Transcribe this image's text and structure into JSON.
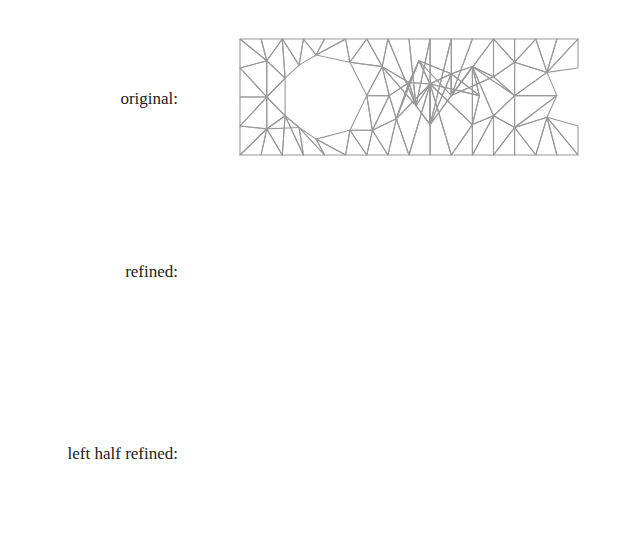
{
  "labels": {
    "original": "original:",
    "refined": "refined:",
    "left_half": "left half refined:"
  },
  "colors": {
    "mesh": "#9a9a9a",
    "frame": "#333333",
    "text": "#333333"
  },
  "chart_data": [
    {
      "type": "mesh",
      "title": "original:",
      "xlabel": "",
      "ylabel": "",
      "xlim": [
        0.0,
        1.2
      ],
      "ylim": [
        0.0,
        0.4
      ],
      "xticks": [
        "0.0",
        "0.2",
        "0.4",
        "0.6",
        "0.8",
        "1.0",
        "1.2"
      ],
      "yticks": [
        "0.0",
        "0.1",
        "0.2",
        "0.3",
        "0.4"
      ],
      "refinement": "none",
      "frame": {
        "left": 223,
        "top": 33,
        "right": 596,
        "bottom": 160
      },
      "data_px": {
        "x0": 240,
        "x1": 578,
        "y0": 155,
        "y1": 39
      }
    },
    {
      "type": "mesh",
      "title": "refined:",
      "xlim": [
        0.0,
        1.2
      ],
      "ylim": [
        0.0,
        0.4
      ],
      "xticks": [
        "0.0",
        "0.2",
        "0.4",
        "0.6",
        "0.8",
        "1.0",
        "1.2"
      ],
      "yticks": [
        "0.0",
        "0.1",
        "0.2",
        "0.3",
        "0.4"
      ],
      "refinement": "all",
      "frame": {
        "left": 223,
        "top": 205,
        "right": 596,
        "bottom": 333
      },
      "data_px": {
        "x0": 240,
        "x1": 578,
        "y0": 328,
        "y1": 213
      }
    },
    {
      "type": "mesh",
      "title": "left half refined:",
      "xlim": [
        0.0,
        1.2
      ],
      "ylim": [
        0.0,
        0.4
      ],
      "xticks": [
        "0.0",
        "0.2",
        "0.4",
        "0.6",
        "0.8",
        "1.0",
        "1.2"
      ],
      "yticks": [
        "0.0",
        "0.1",
        "0.2",
        "0.3",
        "0.4"
      ],
      "refinement": "x<0.68",
      "frame": {
        "left": 223,
        "top": 389,
        "right": 596,
        "bottom": 516
      },
      "data_px": {
        "x0": 240,
        "x1": 578,
        "y0": 510,
        "y1": 395
      }
    }
  ],
  "mesh": {
    "domain": [
      [
        0,
        0
      ],
      [
        1.2,
        0
      ],
      [
        1.2,
        0.4
      ],
      [
        0,
        0.4
      ]
    ],
    "hole": [
      [
        0.16,
        0.265
      ],
      [
        0.21,
        0.31
      ],
      [
        0.27,
        0.345
      ],
      [
        0.39,
        0.32
      ],
      [
        0.45,
        0.205
      ],
      [
        0.39,
        0.085
      ],
      [
        0.27,
        0.055
      ],
      [
        0.21,
        0.095
      ],
      [
        0.16,
        0.135
      ]
    ],
    "vertices": [
      [
        0,
        0
      ],
      [
        0.075,
        0
      ],
      [
        0.15,
        0
      ],
      [
        0.225,
        0
      ],
      [
        0.3,
        0
      ],
      [
        0.375,
        0
      ],
      [
        0.45,
        0
      ],
      [
        0.525,
        0
      ],
      [
        0.6,
        0
      ],
      [
        0.675,
        0
      ],
      [
        0.75,
        0
      ],
      [
        0.825,
        0
      ],
      [
        0.9,
        0
      ],
      [
        0.975,
        0
      ],
      [
        1.05,
        0
      ],
      [
        1.125,
        0
      ],
      [
        1.2,
        0
      ],
      [
        0,
        0.4
      ],
      [
        0.075,
        0.4
      ],
      [
        0.15,
        0.4
      ],
      [
        0.225,
        0.4
      ],
      [
        0.3,
        0.4
      ],
      [
        0.375,
        0.4
      ],
      [
        0.45,
        0.4
      ],
      [
        0.525,
        0.4
      ],
      [
        0.6,
        0.4
      ],
      [
        0.675,
        0.4
      ],
      [
        0.75,
        0.4
      ],
      [
        0.825,
        0.4
      ],
      [
        0.9,
        0.4
      ],
      [
        0.975,
        0.4
      ],
      [
        1.05,
        0.4
      ],
      [
        1.125,
        0.4
      ],
      [
        1.2,
        0.4
      ],
      [
        0,
        0.1
      ],
      [
        0,
        0.2
      ],
      [
        0,
        0.3
      ],
      [
        1.2,
        0.1
      ],
      [
        1.2,
        0.2
      ],
      [
        1.2,
        0.3
      ],
      [
        0.095,
        0.09
      ],
      [
        0.095,
        0.2
      ],
      [
        0.095,
        0.325
      ],
      [
        0.16,
        0.265
      ],
      [
        0.21,
        0.31
      ],
      [
        0.27,
        0.345
      ],
      [
        0.39,
        0.32
      ],
      [
        0.45,
        0.205
      ],
      [
        0.39,
        0.085
      ],
      [
        0.27,
        0.055
      ],
      [
        0.21,
        0.095
      ],
      [
        0.16,
        0.135
      ],
      [
        0.505,
        0.305
      ],
      [
        0.53,
        0.205
      ],
      [
        0.47,
        0.085
      ],
      [
        0.555,
        0.125
      ],
      [
        0.6,
        0.25
      ],
      [
        0.625,
        0.17
      ],
      [
        0.635,
        0.325
      ],
      [
        0.675,
        0.245
      ],
      [
        0.675,
        0.105
      ],
      [
        0.75,
        0.28
      ],
      [
        0.75,
        0.205
      ],
      [
        0.825,
        0.305
      ],
      [
        0.85,
        0.205
      ],
      [
        0.825,
        0.105
      ],
      [
        0.9,
        0.27
      ],
      [
        0.9,
        0.135
      ],
      [
        0.975,
        0.32
      ],
      [
        0.975,
        0.205
      ],
      [
        0.975,
        0.095
      ],
      [
        1.09,
        0.285
      ],
      [
        1.125,
        0.205
      ],
      [
        1.09,
        0.13
      ]
    ],
    "triangles": [
      [
        0,
        1,
        40
      ],
      [
        0,
        34,
        40
      ],
      [
        1,
        2,
        40
      ],
      [
        2,
        3,
        51
      ],
      [
        2,
        40,
        51
      ],
      [
        40,
        51,
        50
      ],
      [
        3,
        4,
        50
      ],
      [
        3,
        50,
        51
      ],
      [
        4,
        5,
        49
      ],
      [
        4,
        49,
        50
      ],
      [
        5,
        6,
        48
      ],
      [
        5,
        48,
        49
      ],
      [
        6,
        7,
        54
      ],
      [
        6,
        48,
        54
      ],
      [
        7,
        8,
        55
      ],
      [
        7,
        54,
        55
      ],
      [
        8,
        9,
        59
      ],
      [
        8,
        55,
        59
      ],
      [
        9,
        10,
        59
      ],
      [
        10,
        11,
        65
      ],
      [
        10,
        59,
        65
      ],
      [
        11,
        12,
        67
      ],
      [
        11,
        65,
        67
      ],
      [
        12,
        13,
        70
      ],
      [
        12,
        67,
        70
      ],
      [
        13,
        14,
        70
      ],
      [
        14,
        15,
        73
      ],
      [
        14,
        70,
        73
      ],
      [
        15,
        16,
        73
      ],
      [
        16,
        37,
        73
      ],
      [
        34,
        35,
        41
      ],
      [
        34,
        40,
        41
      ],
      [
        40,
        41,
        51
      ],
      [
        41,
        51,
        43
      ],
      [
        41,
        43,
        42
      ],
      [
        35,
        36,
        41
      ],
      [
        36,
        42,
        41
      ],
      [
        36,
        17,
        42
      ],
      [
        17,
        18,
        42
      ],
      [
        18,
        19,
        42
      ],
      [
        19,
        43,
        42
      ],
      [
        19,
        20,
        44
      ],
      [
        19,
        43,
        44
      ],
      [
        20,
        21,
        45
      ],
      [
        20,
        44,
        45
      ],
      [
        21,
        22,
        45
      ],
      [
        22,
        46,
        45
      ],
      [
        22,
        23,
        46
      ],
      [
        23,
        24,
        52
      ],
      [
        23,
        46,
        52
      ],
      [
        24,
        25,
        57
      ],
      [
        24,
        52,
        57
      ],
      [
        25,
        26,
        57
      ],
      [
        26,
        27,
        60
      ],
      [
        26,
        57,
        60
      ],
      [
        27,
        28,
        62
      ],
      [
        27,
        60,
        62
      ],
      [
        28,
        29,
        62
      ],
      [
        29,
        30,
        68
      ],
      [
        29,
        62,
        66
      ],
      [
        29,
        66,
        68
      ],
      [
        30,
        31,
        68
      ],
      [
        31,
        32,
        71
      ],
      [
        31,
        68,
        71
      ],
      [
        32,
        33,
        71
      ],
      [
        33,
        39,
        71
      ],
      [
        46,
        47,
        52
      ],
      [
        47,
        53,
        52
      ],
      [
        47,
        48,
        54
      ],
      [
        47,
        53,
        54
      ],
      [
        53,
        54,
        55
      ],
      [
        52,
        53,
        56
      ],
      [
        52,
        56,
        57
      ],
      [
        53,
        55,
        56
      ],
      [
        55,
        56,
        58
      ],
      [
        56,
        57,
        59
      ],
      [
        56,
        58,
        59
      ],
      [
        57,
        59,
        60
      ],
      [
        58,
        59,
        61
      ],
      [
        55,
        58,
        59
      ],
      [
        59,
        60,
        61
      ],
      [
        60,
        61,
        62
      ],
      [
        61,
        62,
        63
      ],
      [
        58,
        61,
        62
      ],
      [
        61,
        63,
        64
      ],
      [
        59,
        61,
        64
      ],
      [
        59,
        64,
        65
      ],
      [
        62,
        63,
        66
      ],
      [
        63,
        64,
        65
      ],
      [
        63,
        65,
        67
      ],
      [
        63,
        66,
        69
      ],
      [
        63,
        67,
        69
      ],
      [
        66,
        68,
        69
      ],
      [
        67,
        69,
        70
      ],
      [
        68,
        69,
        71
      ],
      [
        69,
        70,
        72
      ],
      [
        69,
        71,
        72
      ],
      [
        70,
        72,
        73
      ],
      [
        71,
        72,
        74
      ],
      [
        72,
        73,
        75
      ],
      [
        72,
        74,
        75
      ],
      [
        73,
        75,
        37
      ],
      [
        74,
        75,
        38
      ],
      [
        75,
        37,
        38
      ],
      [
        74,
        38,
        39
      ],
      [
        71,
        74,
        39
      ]
    ]
  }
}
